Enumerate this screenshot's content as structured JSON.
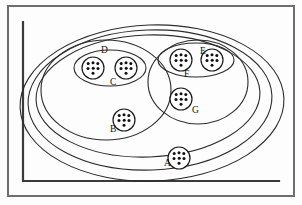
{
  "figure": {
    "style": "hand-drawn line art, black on white",
    "frame": {
      "name": "outer-border-rectangle",
      "stroke_color": "#6e6e6e",
      "x": 8,
      "y": 6,
      "width": 286,
      "height": 190
    },
    "axis": {
      "name": "inner-L-axis-line",
      "stroke_color": "#3a3a3a",
      "vertical_x": 23,
      "vertical_y_top": 22,
      "vertical_y_bottom": 181,
      "horizontal_y": 181,
      "horizontal_x_end": 279
    }
  },
  "sets": [
    {
      "id": "outer-1",
      "label": "",
      "cx": 152,
      "cy": 103,
      "rx": 132,
      "ry": 78,
      "rotation": -2
    },
    {
      "id": "outer-2",
      "label": "",
      "cx": 150,
      "cy": 100,
      "rx": 122,
      "ry": 70,
      "rotation": -2
    },
    {
      "id": "outer-3",
      "label": "",
      "cx": 148,
      "cy": 96,
      "rx": 112,
      "ry": 61,
      "rotation": -2
    },
    {
      "id": "set-left-big",
      "label": "",
      "cx": 106,
      "cy": 90,
      "rx": 65,
      "ry": 50,
      "rotation": 0
    },
    {
      "id": "set-right-big",
      "label": "",
      "cx": 198,
      "cy": 82,
      "rx": 50,
      "ry": 42,
      "rotation": 0
    },
    {
      "id": "set-D",
      "label": "D",
      "cx": 110,
      "cy": 68,
      "rx": 36,
      "ry": 18,
      "rotation": 0,
      "label_x": 101,
      "label_y": 53
    },
    {
      "id": "set-F",
      "label": "F",
      "cx": 196,
      "cy": 60,
      "rx": 38,
      "ry": 17,
      "rotation": 0,
      "label_x": 184,
      "label_y": 77
    }
  ],
  "clusters": [
    {
      "id": "cluster-D-left",
      "label": "",
      "cx": 93,
      "cy": 68,
      "r": 11,
      "dot_count": 7
    },
    {
      "id": "cluster-D-right",
      "label": "C",
      "cx": 126,
      "cy": 68,
      "r": 11,
      "dot_count": 7,
      "label_x": 110,
      "label_y": 85
    },
    {
      "id": "cluster-B",
      "label": "B",
      "cx": 124,
      "cy": 120,
      "r": 11,
      "dot_count": 7,
      "label_x": 110,
      "label_y": 132
    },
    {
      "id": "cluster-F-left",
      "label": "",
      "cx": 181,
      "cy": 60,
      "r": 11,
      "dot_count": 7
    },
    {
      "id": "cluster-F-right",
      "label": "E",
      "cx": 212,
      "cy": 60,
      "r": 11,
      "dot_count": 7,
      "label_x": 200,
      "label_y": 54
    },
    {
      "id": "cluster-G",
      "label": "G",
      "cx": 181,
      "cy": 99,
      "r": 11,
      "dot_count": 7,
      "label_x": 192,
      "label_y": 113
    },
    {
      "id": "cluster-A",
      "label": "A",
      "cx": 179,
      "cy": 158,
      "r": 11,
      "dot_count": 7,
      "label_x": 164,
      "label_y": 166
    }
  ],
  "labels": {
    "A": "A",
    "B": "B",
    "C": "C",
    "D": "D",
    "E": "E",
    "F": "F",
    "G": "G"
  }
}
